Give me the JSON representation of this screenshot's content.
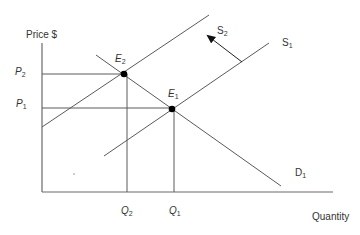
{
  "diagram": {
    "type": "supply-demand",
    "y_axis_label": "Price $",
    "x_axis_label": "Quantity",
    "colors": {
      "line": "#5a5a5a",
      "axis": "#6a6a6a",
      "point": "#000000",
      "text": "#333333"
    },
    "price_levels": [
      {
        "base": "P",
        "sub": "2",
        "y": 74
      },
      {
        "base": "P",
        "sub": "1",
        "y": 108
      }
    ],
    "quantity_levels": [
      {
        "base": "Q",
        "sub": "2",
        "x": 127
      },
      {
        "base": "Q",
        "sub": "1",
        "x": 174
      }
    ],
    "equilibria": [
      {
        "base": "E",
        "sub": "2",
        "x": 124,
        "y": 74
      },
      {
        "base": "E",
        "sub": "1",
        "x": 172,
        "y": 109
      }
    ],
    "curves": {
      "supply_original": {
        "base": "S",
        "sub": "1"
      },
      "supply_shifted": {
        "base": "S",
        "sub": "2"
      },
      "demand": {
        "base": "D",
        "sub": "1"
      }
    },
    "shift_arrow": "supply shifts left from S1 to S2"
  }
}
